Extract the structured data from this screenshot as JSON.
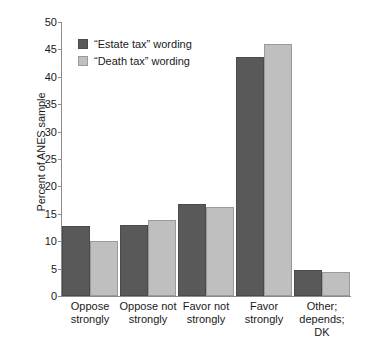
{
  "chart_data": {
    "type": "bar",
    "title": "",
    "xlabel": "",
    "ylabel": "Percent of ANES sample",
    "ylim": [
      0,
      50
    ],
    "ytick_step": 5,
    "yticks": [
      50,
      45,
      40,
      35,
      30,
      25,
      20,
      15,
      10,
      5,
      0
    ],
    "grid": false,
    "legend_position": "upper left",
    "categories": [
      "Oppose strongly",
      "Oppose not strongly",
      "Favor not strongly",
      "Favor strongly",
      "Other; depends; DK"
    ],
    "category_lines": [
      [
        "Oppose",
        "strongly"
      ],
      [
        "Oppose not",
        "strongly"
      ],
      [
        "Favor not",
        "strongly"
      ],
      [
        "Favor",
        "strongly"
      ],
      [
        "Other;",
        "depends;",
        "DK"
      ]
    ],
    "series": [
      {
        "name": "“Estate tax” wording",
        "color": "#595959",
        "values": [
          12.7,
          12.9,
          16.8,
          43.6,
          4.7
        ]
      },
      {
        "name": "“Death tax” wording",
        "color": "#bfbfbf",
        "values": [
          10.0,
          13.8,
          16.2,
          46.0,
          4.4
        ]
      }
    ]
  },
  "colors": {
    "background": "#ffffff",
    "axis": "#8c8c8c",
    "text": "#1a1a1a",
    "series_dark": "#595959",
    "series_light": "#bfbfbf"
  }
}
